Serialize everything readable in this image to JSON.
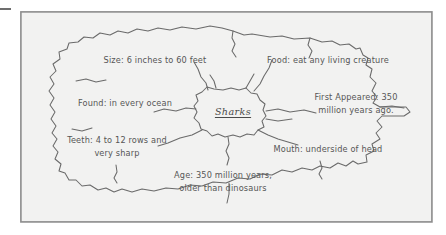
{
  "document": {
    "type": "hand-drawn concept map",
    "topic": "Sharks"
  },
  "map": {
    "center": {
      "label": "Sharks"
    },
    "branches": [
      {
        "id": "size",
        "text": "Size: 6 inches to 60 feet",
        "lines": [
          "Size: 6 inches to 60 feet"
        ],
        "position": "top-left"
      },
      {
        "id": "food",
        "text": "Food: eat any living creature",
        "lines": [
          "Food: eat any living creature"
        ],
        "position": "top-right"
      },
      {
        "id": "found",
        "text": "Found: in every ocean",
        "lines": [
          "Found: in every ocean"
        ],
        "position": "left"
      },
      {
        "id": "first-appeared",
        "text": "First Appeared: 350 million years ago.",
        "lines": [
          "First Appeared: 350",
          "million years ago."
        ],
        "position": "right"
      },
      {
        "id": "teeth",
        "text": "Teeth: 4 to 12 rows and very sharp",
        "lines": [
          "Teeth: 4 to 12 rows and",
          "very sharp"
        ],
        "position": "lower-left"
      },
      {
        "id": "mouth",
        "text": "Mouth: underside of head",
        "lines": [
          "Mouth: underside of head"
        ],
        "position": "lower-right"
      },
      {
        "id": "age",
        "text": "Age: 350 million years, older than dinosaurs",
        "lines": [
          "Age: 350 million years,",
          "older than dinosaurs"
        ],
        "position": "bottom"
      }
    ]
  },
  "colors": {
    "ink": "#565656",
    "outline": "#6a6a6a",
    "frame": "#8d8d8d",
    "paper": "#f2f2f1",
    "page": "#ffffff"
  }
}
